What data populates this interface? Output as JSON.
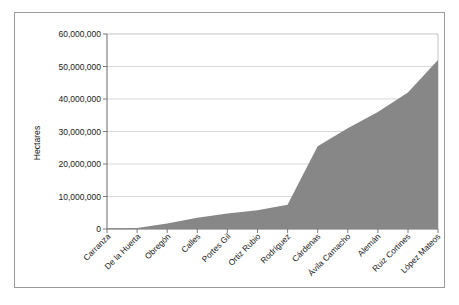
{
  "chart_data": {
    "type": "area",
    "title": "",
    "xlabel": "",
    "ylabel": "Hectares",
    "ylim": [
      0,
      60000000
    ],
    "grid": true,
    "legend": "none",
    "categories": [
      "Carranza",
      "De la Huerta",
      "Obregón",
      "Calles",
      "Portes Gil",
      "Ortiz Rubio",
      "Rodríguez",
      "Cárdenas",
      "Ávila Camacho",
      "Alemán",
      "Ruiz Cortines",
      "López Mateos"
    ],
    "values": [
      200000,
      300000,
      1700000,
      3500000,
      4800000,
      5800000,
      7500000,
      25500000,
      31000000,
      36000000,
      42000000,
      52000000
    ],
    "ytick_labels": [
      "60,000,000",
      "50,000,000",
      "40,000,000",
      "30,000,000",
      "20,000,000",
      "10,000,000",
      "0"
    ],
    "ytick_values": [
      60000000,
      50000000,
      40000000,
      30000000,
      20000000,
      10000000,
      0
    ],
    "series_name": "Hectares distributed",
    "fill_color": "#878787",
    "grid_color": "#c9c9c9",
    "axis_color": "#6b6b6b",
    "frame_color": "#9a9a9a"
  },
  "axis": {
    "y_title": "Hectares"
  }
}
